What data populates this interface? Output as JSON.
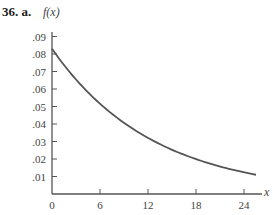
{
  "problem": {
    "number": "36.",
    "part": "a."
  },
  "chart_data": {
    "type": "line",
    "title": "",
    "xlabel": "x",
    "ylabel": "f(x)",
    "xlim": [
      0,
      26
    ],
    "ylim": [
      0,
      0.09
    ],
    "grid": false,
    "legend": null,
    "x_ticks": [
      0,
      6,
      12,
      18,
      24
    ],
    "x_tick_labels": [
      "0",
      "6",
      "12",
      "18",
      "24"
    ],
    "y_ticks": [
      0.01,
      0.02,
      0.03,
      0.04,
      0.05,
      0.06,
      0.07,
      0.08,
      0.09
    ],
    "y_tick_labels": [
      ".01",
      ".02",
      ".03",
      ".04",
      ".05",
      ".06",
      ".07",
      ".08",
      ".09"
    ],
    "series": [
      {
        "name": "f(x)",
        "x": [
          0,
          3,
          6,
          9,
          12,
          15,
          18,
          21,
          24,
          25.5
        ],
        "values": [
          0.083,
          0.066,
          0.052,
          0.041,
          0.033,
          0.026,
          0.021,
          0.016,
          0.013,
          0.011
        ]
      }
    ],
    "color": "#555555"
  }
}
